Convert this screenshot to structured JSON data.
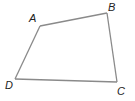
{
  "diagram": {
    "type": "quadrilateral",
    "stroke_color": "#8a8a8a",
    "label_color": "#222222",
    "vertices": [
      {
        "name": "A",
        "x": 40,
        "y": 26,
        "label_x": 29,
        "label_y": 22
      },
      {
        "name": "B",
        "x": 107,
        "y": 13,
        "label_x": 108,
        "label_y": 11
      },
      {
        "name": "C",
        "x": 117,
        "y": 82,
        "label_x": 117,
        "label_y": 95
      },
      {
        "name": "D",
        "x": 15,
        "y": 79,
        "label_x": 5,
        "label_y": 89
      }
    ],
    "edges": [
      [
        "A",
        "B"
      ],
      [
        "B",
        "C"
      ],
      [
        "C",
        "D"
      ],
      [
        "D",
        "A"
      ]
    ]
  }
}
